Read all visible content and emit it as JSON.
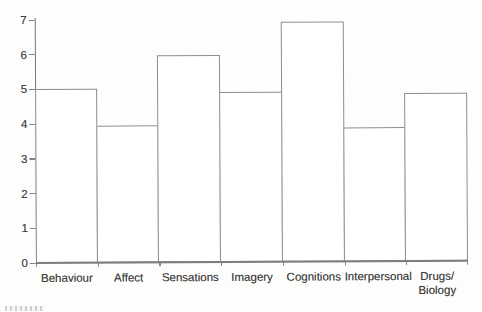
{
  "figure": {
    "background": "#fdfdfc",
    "style": "scanned-book-figure"
  },
  "chart_data": {
    "type": "bar",
    "title": "",
    "xlabel": "",
    "ylabel": "",
    "categories": [
      "Behaviour",
      "Affect",
      "Sensations",
      "Imagery",
      "Cognitions",
      "Interpersonal",
      "Drugs/\nBiology"
    ],
    "values": [
      5.0,
      3.95,
      5.95,
      4.9,
      6.9,
      3.85,
      4.85
    ],
    "ylim": [
      0,
      7
    ],
    "yticks": [
      0,
      1,
      2,
      3,
      4,
      5,
      6,
      7
    ],
    "grid": false,
    "legend": null,
    "bars_adjacent": true,
    "bar_fill": "#ffffff",
    "bar_border": "#8e8e8e",
    "axis_color": "#7d7d7d",
    "tick_label_color": "#414141"
  }
}
